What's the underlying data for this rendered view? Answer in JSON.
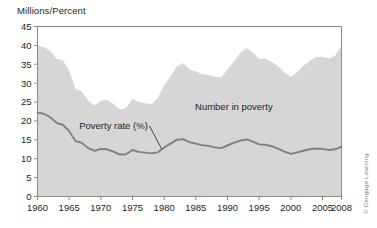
{
  "chart_data": {
    "type": "area",
    "title": "",
    "ylabel": "Millions/Percent",
    "xlabel": "",
    "ylim": [
      0,
      45
    ],
    "xlim": [
      1960,
      2008
    ],
    "ytick_labels": [
      "0",
      "5",
      "10",
      "15",
      "20",
      "25",
      "30",
      "35",
      "40",
      "45"
    ],
    "ytick_values": [
      0,
      5,
      10,
      15,
      20,
      25,
      30,
      35,
      40,
      45
    ],
    "xtick_labels": [
      "1960",
      "1965",
      "1970",
      "1975",
      "1980",
      "1985",
      "1990",
      "1995",
      "2000",
      "2005",
      "2008"
    ],
    "xtick_values": [
      1960,
      1965,
      1970,
      1975,
      1980,
      1985,
      1990,
      1995,
      2000,
      2005,
      2008
    ],
    "grid": false,
    "legend_position": "inline-annotations",
    "colors": {
      "area_fill": "#d6d6d6",
      "line": "#808080",
      "frame": "#8c8c8c",
      "text": "#231f20",
      "background": "#ffffff"
    },
    "annotations": [
      {
        "text": "Number in poverty",
        "x": 1991,
        "y": 23
      },
      {
        "text": "Poverty rate (%)",
        "x": 1972,
        "y": 18
      }
    ],
    "series": [
      {
        "name": "Number in poverty",
        "type": "area",
        "units": "millions",
        "x": [
          1960,
          1961,
          1962,
          1963,
          1964,
          1965,
          1966,
          1967,
          1968,
          1969,
          1970,
          1971,
          1972,
          1973,
          1974,
          1975,
          1976,
          1977,
          1978,
          1979,
          1980,
          1981,
          1982,
          1983,
          1984,
          1985,
          1986,
          1987,
          1988,
          1989,
          1990,
          1991,
          1992,
          1993,
          1994,
          1995,
          1996,
          1997,
          1998,
          1999,
          2000,
          2001,
          2002,
          2003,
          2004,
          2005,
          2006,
          2007,
          2008
        ],
        "values": [
          39.9,
          39.6,
          38.6,
          36.4,
          36.1,
          33.2,
          28.5,
          27.8,
          25.4,
          24.1,
          25.4,
          25.6,
          24.5,
          23.0,
          23.4,
          25.9,
          25.0,
          24.7,
          24.5,
          26.1,
          29.3,
          31.8,
          34.4,
          35.3,
          33.7,
          33.1,
          32.4,
          32.2,
          31.7,
          31.5,
          33.6,
          35.7,
          38.0,
          39.3,
          38.1,
          36.4,
          36.5,
          35.6,
          34.5,
          32.8,
          31.6,
          32.9,
          34.6,
          35.9,
          37.0,
          37.0,
          36.5,
          37.3,
          39.8
        ]
      },
      {
        "name": "Poverty rate (%)",
        "type": "line",
        "units": "percent",
        "x": [
          1960,
          1961,
          1962,
          1963,
          1964,
          1965,
          1966,
          1967,
          1968,
          1969,
          1970,
          1971,
          1972,
          1973,
          1974,
          1975,
          1976,
          1977,
          1978,
          1979,
          1980,
          1981,
          1982,
          1983,
          1984,
          1985,
          1986,
          1987,
          1988,
          1989,
          1990,
          1991,
          1992,
          1993,
          1994,
          1995,
          1996,
          1997,
          1998,
          1999,
          2000,
          2001,
          2002,
          2003,
          2004,
          2005,
          2006,
          2007,
          2008
        ],
        "values": [
          22.2,
          21.9,
          21.0,
          19.5,
          19.0,
          17.3,
          14.7,
          14.2,
          12.8,
          12.1,
          12.6,
          12.5,
          11.9,
          11.1,
          11.2,
          12.3,
          11.8,
          11.6,
          11.4,
          11.7,
          13.0,
          14.0,
          15.0,
          15.2,
          14.4,
          14.0,
          13.6,
          13.4,
          13.0,
          12.8,
          13.5,
          14.2,
          14.8,
          15.1,
          14.5,
          13.8,
          13.7,
          13.3,
          12.7,
          11.9,
          11.3,
          11.7,
          12.1,
          12.5,
          12.7,
          12.6,
          12.3,
          12.5,
          13.2
        ]
      }
    ]
  },
  "figure": {
    "axis_title": "Millions/Percent",
    "credit": "© Cengage Learning",
    "annotation_number": "Number in poverty",
    "annotation_rate": "Poverty rate (%)"
  }
}
